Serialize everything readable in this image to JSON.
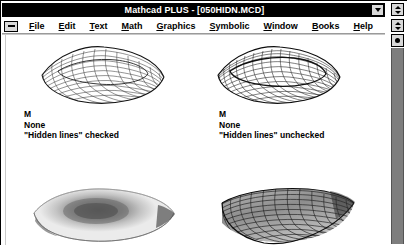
{
  "window": {
    "title": "Mathcad PLUS - [050HIDN.MCD]",
    "system_menu_icon": "window-system-menu-icon",
    "document_menu_icon": "document-system-menu-icon",
    "minimize_icon": "minimize-icon",
    "restore_icon": "restore-icon",
    "titlebar_color": "#000000",
    "titlebar_text_color": "#ffffff"
  },
  "menubar": {
    "items": [
      {
        "label": "File",
        "accel": "F"
      },
      {
        "label": "Edit",
        "accel": "E"
      },
      {
        "label": "Text",
        "accel": "T"
      },
      {
        "label": "Math",
        "accel": "M"
      },
      {
        "label": "Graphics",
        "accel": "G"
      },
      {
        "label": "Symbolic",
        "accel": "S"
      },
      {
        "label": "Window",
        "accel": "W"
      },
      {
        "label": "Books",
        "accel": "B"
      },
      {
        "label": "Help",
        "accel": "H"
      }
    ]
  },
  "scrollbar": {
    "up_arrow_icon": "scroll-up-icon",
    "down_arrow_icon": "scroll-down-icon",
    "thumb_icon": "scroll-thumb-icon",
    "trough_color": "#7e7e7e"
  },
  "document": {
    "plots": [
      {
        "id": "plot-top-left",
        "render_style": "wireframe-mesh",
        "caption": {
          "line1": "M",
          "line2": "None",
          "line3": "\"Hidden lines\" checked"
        }
      },
      {
        "id": "plot-top-right",
        "render_style": "wireframe-mesh-dense",
        "caption": {
          "line1": "M",
          "line2": "None",
          "line3": "\"Hidden lines\" unchecked"
        }
      },
      {
        "id": "plot-bottom-left",
        "render_style": "filled-shaded-surface",
        "caption": {
          "line1": "",
          "line2": "",
          "line3": ""
        }
      },
      {
        "id": "plot-bottom-right",
        "render_style": "filled-mesh-surface",
        "caption": {
          "line1": "",
          "line2": "",
          "line3": ""
        }
      }
    ]
  }
}
